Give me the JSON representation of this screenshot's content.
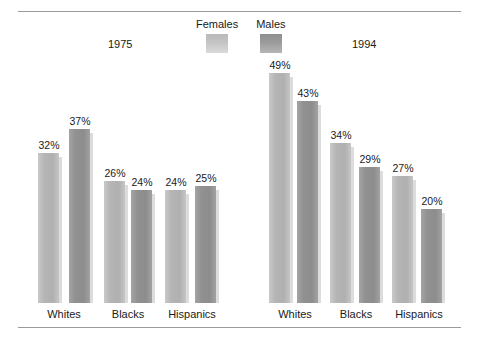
{
  "chart_data": {
    "type": "bar",
    "title": "",
    "subtitle": "",
    "xlabel": "",
    "ylabel": "",
    "ylim": [
      0,
      52
    ],
    "grid": false,
    "legend_position": "top-center",
    "value_suffix": "%",
    "panels": [
      {
        "name": "1975",
        "categories": [
          "Whites",
          "Blacks",
          "Hispanics"
        ],
        "series": [
          {
            "name": "Females",
            "values": [
              32,
              26,
              24
            ]
          },
          {
            "name": "Males",
            "values": [
              37,
              24,
              25
            ]
          }
        ]
      },
      {
        "name": "1994",
        "categories": [
          "Whites",
          "Blacks",
          "Hispanics"
        ],
        "series": [
          {
            "name": "Females",
            "values": [
              49,
              34,
              27
            ]
          },
          {
            "name": "Males",
            "values": [
              43,
              29,
              20
            ]
          }
        ]
      }
    ],
    "labels": {
      "p0_whites_female": "32%",
      "p0_whites_male": "37%",
      "p0_blacks_female": "26%",
      "p0_blacks_male": "24%",
      "p0_hispanics_female": "24%",
      "p0_hispanics_male": "25%",
      "p1_whites_female": "49%",
      "p1_whites_male": "43%",
      "p1_blacks_female": "34%",
      "p1_blacks_male": "29%",
      "p1_hispanics_female": "27%",
      "p1_hispanics_male": "20%"
    },
    "colors": {
      "females": "#b5b5b5",
      "males": "#919191",
      "baseline": "#8c8c8c",
      "rule": "#9a9a9a",
      "text": "#1a1a1a",
      "background": "#ffffff"
    }
  },
  "legend": {
    "females_label": "Females",
    "males_label": "Males"
  },
  "panel_titles": {
    "left": "1975",
    "right": "1994"
  },
  "categories": {
    "p0_c0": "Whites",
    "p0_c1": "Blacks",
    "p0_c2": "Hispanics",
    "p1_c0": "Whites",
    "p1_c1": "Blacks",
    "p1_c2": "Hispanics"
  }
}
